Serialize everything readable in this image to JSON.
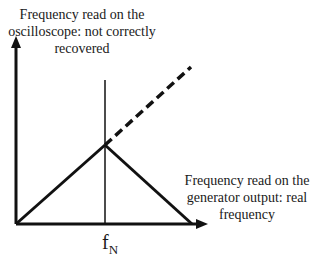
{
  "diagram": {
    "y_axis_label": "Frequency read on the oscilloscope: not correctly recovered",
    "x_axis_label": "Frequency read on the generator output: real frequency",
    "nyquist_label_main": "f",
    "nyquist_label_sub": "N",
    "colors": {
      "line": "#111111",
      "background": "#ffffff"
    }
  }
}
